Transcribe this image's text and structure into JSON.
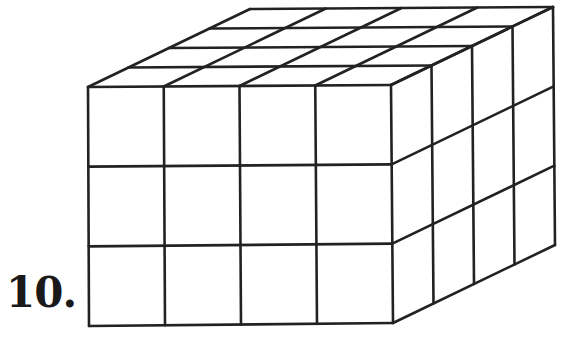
{
  "problem": {
    "number_label": "10."
  },
  "figure": {
    "dimensions": {
      "width_cubes": 4,
      "height_cubes": 3,
      "depth_cubes": 4
    },
    "line_color": "#222222",
    "background": "#ffffff"
  }
}
